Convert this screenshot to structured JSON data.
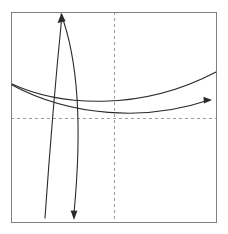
{
  "figure": {
    "title": "",
    "background_color": "#ffffff",
    "width": 228,
    "height": 234
  },
  "chart_data": {
    "type": "line",
    "title": "",
    "subtitle": "",
    "xlabel": "",
    "ylabel": "",
    "xlim": [
      0,
      1
    ],
    "ylim": [
      0,
      1
    ],
    "xticks": [],
    "yticks": [],
    "xtick_labels": [],
    "ytick_labels": [],
    "grid": false,
    "legend": null,
    "legend_position": "none",
    "annotations": [],
    "frame": {
      "label": "plot-frame",
      "color": "#808080",
      "line_width": 1,
      "x_left_px": 11,
      "x_right_px": 216,
      "y_top_px": 12,
      "y_bottom_px": 222
    },
    "reference_lines": [
      {
        "name": "vertical-dashed-axis",
        "orientation": "vertical",
        "value_px": 114,
        "style": "dashed",
        "color": "#9a9a9a"
      },
      {
        "name": "horizontal-dashed-axis",
        "orientation": "horizontal",
        "value_px": 118,
        "style": "dashed",
        "color": "#9a9a9a"
      }
    ],
    "curve_color": "#2b2b2b",
    "curve_width": 1.1,
    "series": [
      {
        "name": "steep-curve-left",
        "arrow": "none",
        "direction": "downward-left",
        "path": "M 62,15 C 56,75 49,160 45,218",
        "endpoints_px": [
          [
            62,
            15
          ],
          [
            45,
            218
          ]
        ]
      },
      {
        "name": "steep-curve-right",
        "arrow": "end-down",
        "direction": "downward-left",
        "path": "M 61,14 C 82,70 80,150 74,213",
        "endpoints_px": [
          [
            61,
            14
          ],
          [
            74,
            213
          ]
        ]
      },
      {
        "name": "shallow-curve-upper",
        "arrow": "none",
        "direction": "rightward-rising",
        "path": "M 12,84 C 60,106 140,112 216,72",
        "endpoints_px": [
          [
            12,
            84
          ],
          [
            216,
            72
          ]
        ]
      },
      {
        "name": "shallow-curve-lower",
        "arrow": "end-right",
        "direction": "rightward-rising",
        "path": "M 12,85 C 70,116 145,122 209,100",
        "endpoints_px": [
          [
            12,
            85
          ],
          [
            209,
            100
          ]
        ]
      }
    ]
  }
}
